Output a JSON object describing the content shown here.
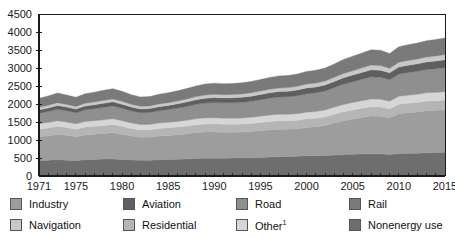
{
  "chart_data": {
    "type": "area",
    "title": "",
    "xlabel": "",
    "ylabel": "",
    "stacked": true,
    "grid": false,
    "legend_position": "bottom",
    "ylim": [
      0,
      4500
    ],
    "ytick_step": 500,
    "yticks": [
      0,
      500,
      1000,
      1500,
      2000,
      2500,
      3000,
      3500,
      4000,
      4500
    ],
    "xlim": [
      1971,
      2015
    ],
    "xticks": [
      1971,
      1975,
      1980,
      1985,
      1990,
      1995,
      2000,
      2005,
      2010,
      2015
    ],
    "x": [
      1971,
      1972,
      1973,
      1974,
      1975,
      1976,
      1977,
      1978,
      1979,
      1980,
      1981,
      1982,
      1983,
      1984,
      1985,
      1986,
      1987,
      1988,
      1989,
      1990,
      1991,
      1992,
      1993,
      1994,
      1995,
      1996,
      1997,
      1998,
      1999,
      2000,
      2001,
      2002,
      2003,
      2004,
      2005,
      2006,
      2007,
      2008,
      2009,
      2010,
      2011,
      2012,
      2013,
      2014,
      2015
    ],
    "series": [
      {
        "name": "Nonenergy use",
        "color": "#6e6e6e",
        "values": [
          430,
          440,
          455,
          440,
          430,
          450,
          460,
          470,
          475,
          460,
          445,
          435,
          440,
          450,
          455,
          465,
          475,
          485,
          490,
          495,
          495,
          500,
          500,
          505,
          515,
          525,
          535,
          540,
          550,
          560,
          565,
          570,
          580,
          595,
          605,
          615,
          620,
          615,
          595,
          625,
          630,
          635,
          645,
          650,
          660
        ]
      },
      {
        "name": "Industry",
        "color": "#9d9d9d",
        "values": [
          660,
          675,
          700,
          690,
          660,
          690,
          700,
          710,
          725,
          700,
          665,
          640,
          640,
          660,
          670,
          680,
          695,
          720,
          730,
          730,
          720,
          715,
          720,
          730,
          745,
          760,
          765,
          760,
          765,
          790,
          800,
          830,
          890,
          940,
          975,
          1010,
          1045,
          1045,
          1020,
          1105,
          1130,
          1145,
          1170,
          1175,
          1180
        ]
      },
      {
        "name": "Residential",
        "color": "#b5b5b5",
        "values": [
          215,
          220,
          225,
          215,
          210,
          220,
          220,
          222,
          228,
          220,
          212,
          205,
          203,
          208,
          212,
          215,
          218,
          222,
          225,
          225,
          222,
          220,
          222,
          224,
          228,
          232,
          234,
          234,
          236,
          240,
          242,
          244,
          248,
          252,
          256,
          258,
          260,
          258,
          252,
          262,
          263,
          264,
          266,
          266,
          268
        ]
      },
      {
        "name": "Other",
        "color": "#d6d6d6",
        "values": [
          150,
          152,
          156,
          152,
          148,
          154,
          156,
          158,
          162,
          158,
          152,
          148,
          148,
          152,
          154,
          157,
          160,
          163,
          166,
          168,
          167,
          166,
          168,
          170,
          173,
          176,
          178,
          178,
          180,
          184,
          186,
          189,
          194,
          200,
          205,
          210,
          214,
          215,
          210,
          220,
          223,
          226,
          229,
          231,
          234
        ]
      },
      {
        "name": "Road",
        "color": "#8f8f8f",
        "values": [
          290,
          305,
          320,
          315,
          310,
          325,
          335,
          350,
          355,
          345,
          335,
          330,
          335,
          345,
          355,
          370,
          385,
          400,
          415,
          425,
          428,
          435,
          440,
          448,
          458,
          470,
          480,
          488,
          500,
          510,
          518,
          530,
          545,
          565,
          580,
          595,
          615,
          610,
          600,
          620,
          630,
          640,
          650,
          660,
          672
        ]
      },
      {
        "name": "Aviation",
        "color": "#5f5f5f",
        "values": [
          95,
          100,
          105,
          102,
          100,
          105,
          108,
          112,
          115,
          112,
          108,
          105,
          106,
          110,
          113,
          118,
          123,
          128,
          133,
          136,
          136,
          137,
          138,
          141,
          145,
          149,
          153,
          155,
          158,
          163,
          162,
          165,
          170,
          178,
          184,
          190,
          197,
          196,
          190,
          198,
          202,
          205,
          209,
          213,
          218
        ]
      },
      {
        "name": "Navigation",
        "color": "#c8c8c8",
        "values": [
          72,
          74,
          77,
          75,
          73,
          76,
          78,
          80,
          82,
          80,
          77,
          75,
          75,
          77,
          79,
          81,
          84,
          87,
          90,
          91,
          91,
          92,
          93,
          94,
          96,
          99,
          101,
          102,
          104,
          107,
          108,
          110,
          113,
          118,
          122,
          126,
          130,
          130,
          126,
          131,
          133,
          135,
          137,
          139,
          141
        ]
      },
      {
        "name": "Rail",
        "color": "#7a7a7a",
        "values": [
          250,
          258,
          268,
          262,
          256,
          266,
          272,
          278,
          285,
          277,
          266,
          258,
          259,
          266,
          272,
          280,
          288,
          298,
          305,
          308,
          306,
          305,
          308,
          313,
          320,
          328,
          334,
          336,
          342,
          350,
          354,
          360,
          372,
          388,
          400,
          412,
          424,
          422,
          408,
          428,
          436,
          442,
          450,
          456,
          462
        ]
      }
    ]
  },
  "legend": {
    "row1": [
      {
        "label": "Industry",
        "color": "#9d9d9d",
        "name": "industry"
      },
      {
        "label": "Aviation",
        "color": "#5f5f5f",
        "name": "aviation"
      },
      {
        "label": "Road",
        "color": "#8f8f8f",
        "name": "road"
      },
      {
        "label": "Rail",
        "color": "#7a7a7a",
        "name": "rail"
      }
    ],
    "row2": [
      {
        "label": "Navigation",
        "color": "#c8c8c8",
        "name": "navigation"
      },
      {
        "label": "Residential",
        "color": "#b5b5b5",
        "name": "residential"
      },
      {
        "label": "Other",
        "footnote": "1",
        "color": "#d6d6d6",
        "name": "other"
      },
      {
        "label": "Nonenergy use",
        "color": "#6e6e6e",
        "name": "nonenergy-use"
      }
    ]
  },
  "axis": {
    "y_ticks": [
      "0",
      "500",
      "1000",
      "1500",
      "2000",
      "2500",
      "3000",
      "3500",
      "4000",
      "4500"
    ],
    "x_ticks": [
      "1971",
      "1975",
      "1980",
      "1985",
      "1990",
      "1995",
      "2000",
      "2005",
      "2010",
      "2015"
    ]
  }
}
